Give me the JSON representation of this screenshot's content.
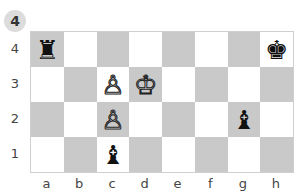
{
  "puzzle": {
    "number": "4"
  },
  "board": {
    "files": [
      "a",
      "b",
      "c",
      "d",
      "e",
      "f",
      "g",
      "h"
    ],
    "ranks": [
      "4",
      "3",
      "2",
      "1"
    ],
    "colors": {
      "dark": "#c9c9c9",
      "light": "#ffffff"
    },
    "pieces": [
      {
        "square": "a4",
        "piece": "rook",
        "color": "black",
        "glyph": "♜"
      },
      {
        "square": "h4",
        "piece": "king",
        "color": "black",
        "glyph": "♚"
      },
      {
        "square": "c3",
        "piece": "pawn",
        "color": "white",
        "glyph": "♙"
      },
      {
        "square": "d3",
        "piece": "king",
        "color": "white",
        "glyph": "♔"
      },
      {
        "square": "c2",
        "piece": "pawn",
        "color": "white",
        "glyph": "♙"
      },
      {
        "square": "g2",
        "piece": "bishop",
        "color": "black",
        "glyph": "♝"
      },
      {
        "square": "c1",
        "piece": "bishop",
        "color": "black",
        "glyph": "♝"
      }
    ]
  }
}
